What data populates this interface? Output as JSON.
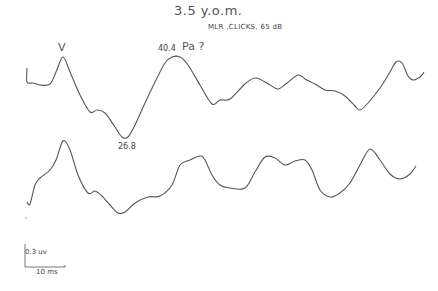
{
  "chart_data": {
    "type": "line",
    "title": "3.5 y.o.m.",
    "subtitle": "MLR, CLICKS, 65 dB",
    "xlabel": "",
    "ylabel": "",
    "grid": false,
    "legend": null,
    "annotations": [
      {
        "text": "V",
        "trace": "top",
        "x": 63,
        "y": 57
      },
      {
        "text": "40.4",
        "trace": "top",
        "x": 175,
        "y": 57
      },
      {
        "text": "Pa ?",
        "trace": "top",
        "x": 175,
        "y": 57
      },
      {
        "text": "26.8",
        "trace": "top",
        "x": 125,
        "y": 137
      }
    ],
    "scale_bar": {
      "vertical": "0.3 uv",
      "horizontal": "10 ms"
    },
    "series": [
      {
        "name": "trace-1",
        "points": [
          [
            27,
            68
          ],
          [
            27,
            82
          ],
          [
            33,
            83
          ],
          [
            40,
            85
          ],
          [
            50,
            84
          ],
          [
            56,
            72
          ],
          [
            63,
            57
          ],
          [
            70,
            72
          ],
          [
            80,
            95
          ],
          [
            90,
            112
          ],
          [
            97,
            110
          ],
          [
            105,
            113
          ],
          [
            115,
            127
          ],
          [
            122,
            137
          ],
          [
            128,
            137
          ],
          [
            135,
            125
          ],
          [
            145,
            103
          ],
          [
            155,
            82
          ],
          [
            165,
            63
          ],
          [
            172,
            57
          ],
          [
            180,
            57
          ],
          [
            188,
            65
          ],
          [
            200,
            85
          ],
          [
            212,
            104
          ],
          [
            220,
            100
          ],
          [
            230,
            99
          ],
          [
            245,
            84
          ],
          [
            256,
            78
          ],
          [
            270,
            85
          ],
          [
            278,
            89
          ],
          [
            287,
            83
          ],
          [
            298,
            75
          ],
          [
            305,
            79
          ],
          [
            315,
            84
          ],
          [
            325,
            90
          ],
          [
            335,
            91
          ],
          [
            345,
            96
          ],
          [
            355,
            106
          ],
          [
            360,
            110
          ],
          [
            368,
            103
          ],
          [
            380,
            88
          ],
          [
            390,
            72
          ],
          [
            396,
            62
          ],
          [
            402,
            63
          ],
          [
            408,
            76
          ],
          [
            413,
            80
          ],
          [
            420,
            77
          ],
          [
            424,
            72
          ]
        ]
      },
      {
        "name": "trace-2",
        "points": [
          [
            27,
            202
          ],
          [
            30,
            204
          ],
          [
            35,
            185
          ],
          [
            40,
            178
          ],
          [
            50,
            170
          ],
          [
            56,
            160
          ],
          [
            63,
            141
          ],
          [
            70,
            150
          ],
          [
            78,
            175
          ],
          [
            88,
            193
          ],
          [
            95,
            191
          ],
          [
            102,
            196
          ],
          [
            110,
            205
          ],
          [
            118,
            213
          ],
          [
            125,
            212
          ],
          [
            135,
            203
          ],
          [
            148,
            197
          ],
          [
            160,
            196
          ],
          [
            172,
            185
          ],
          [
            180,
            165
          ],
          [
            190,
            160
          ],
          [
            200,
            156
          ],
          [
            205,
            160
          ],
          [
            212,
            175
          ],
          [
            220,
            185
          ],
          [
            230,
            188
          ],
          [
            245,
            188
          ],
          [
            255,
            172
          ],
          [
            265,
            157
          ],
          [
            275,
            158
          ],
          [
            285,
            165
          ],
          [
            295,
            161
          ],
          [
            305,
            160
          ],
          [
            312,
            170
          ],
          [
            320,
            190
          ],
          [
            330,
            197
          ],
          [
            340,
            193
          ],
          [
            350,
            183
          ],
          [
            360,
            165
          ],
          [
            370,
            149
          ],
          [
            380,
            160
          ],
          [
            390,
            174
          ],
          [
            400,
            179
          ],
          [
            410,
            174
          ],
          [
            416,
            166
          ]
        ]
      }
    ]
  },
  "labels": {
    "title": "3.5 y.o.m.",
    "subtitle": "MLR ,CLICKS, 65 dB",
    "peak_v": "V",
    "peak_pa_latency": "40.4",
    "peak_pa": "Pa ?",
    "trough_latency": "26.8",
    "scale_vertical": "0.3 uv",
    "scale_horizontal": "10 ms"
  },
  "colors": {
    "trace": "#555555",
    "background": "#ffffff"
  }
}
